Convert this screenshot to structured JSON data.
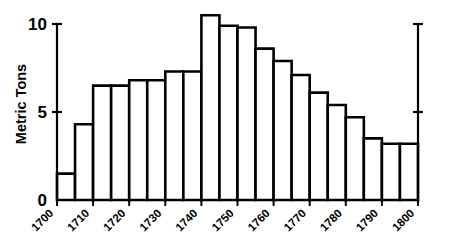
{
  "chart_data": {
    "type": "bar",
    "title": "",
    "subtitle": "",
    "xlabel": "",
    "ylabel": "Metric Tons",
    "categories": [
      "1700",
      "1705",
      "1710",
      "1715",
      "1720",
      "1725",
      "1730",
      "1735",
      "1740",
      "1745",
      "1750",
      "1755",
      "1760",
      "1765",
      "1770",
      "1775",
      "1780",
      "1785",
      "1790",
      "1795"
    ],
    "values": [
      1.5,
      4.3,
      6.5,
      6.5,
      6.8,
      6.8,
      7.3,
      7.3,
      10.5,
      9.9,
      9.8,
      8.6,
      7.9,
      7.1,
      6.1,
      5.4,
      4.7,
      3.5,
      3.2,
      3.2
    ],
    "bin_width_years": 5,
    "x_range": [
      1700,
      1800
    ],
    "ylim": [
      0,
      11
    ],
    "y_ticks": [
      "0",
      "5",
      "10"
    ],
    "y_tick_values": [
      0,
      5,
      10
    ],
    "x_ticks": [
      "1700",
      "1710",
      "1720",
      "1730",
      "1740",
      "1750",
      "1760",
      "1770",
      "1780",
      "1790",
      "1800"
    ],
    "x_tick_values": [
      1700,
      1710,
      1720,
      1730,
      1740,
      1750,
      1760,
      1770,
      1780,
      1790,
      1800
    ],
    "grid": false,
    "legend": [],
    "legend_position": "none",
    "bar_fill_color": "#ffffff",
    "bar_edge_color": "#000000",
    "axis_color": "#000000",
    "background_color": "#ffffff",
    "right_axis_shown": true,
    "right_axis_ticks": [
      5,
      10
    ],
    "x_tick_label_rotation": -45,
    "annotations": []
  }
}
